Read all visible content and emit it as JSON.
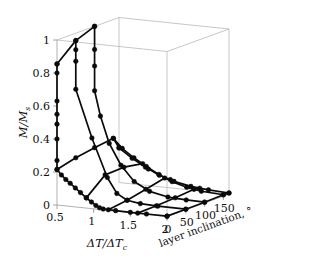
{
  "figure": {
    "name": "3d-surface-mesh-plot",
    "background": "#ffffff",
    "line_color": "#0a0a0a",
    "frame_color": "#b9b9b9",
    "width": 336,
    "height": 264
  },
  "axes": {
    "z": {
      "name": "M/Ms",
      "label_main": "M/M",
      "label_sub": "s",
      "ticks": [
        0,
        0.2,
        0.4,
        0.6,
        0.8,
        1
      ],
      "tick_labels": [
        "0",
        "0.2",
        "0.4",
        "0.6",
        "0.8",
        "1"
      ],
      "range": [
        0,
        1
      ]
    },
    "x": {
      "name": "delta-T-over-delta-Tc",
      "label_main": "ΔT/ΔT",
      "label_sub": "c",
      "ticks": [
        0.5,
        1,
        1.5,
        2
      ],
      "tick_labels": [
        "0.5",
        "1",
        "1.5",
        "2"
      ],
      "range": [
        0.5,
        2
      ]
    },
    "y": {
      "name": "layer-inclination",
      "label_main": "layer inclination, °",
      "ticks": [
        0,
        50,
        100,
        150
      ],
      "tick_labels": [
        "0",
        "50",
        "100",
        "150"
      ],
      "range": [
        0,
        165
      ]
    }
  },
  "chart_data": {
    "type": "line",
    "title": "",
    "xlabel": "ΔT/ΔTc",
    "ylabel": "layer inclination, °",
    "zlabel": "M/Ms",
    "xlim": [
      0.5,
      2
    ],
    "ylim": [
      0,
      165
    ],
    "zlim": [
      0,
      1
    ],
    "grid": false,
    "legend": "none",
    "projection": "3d",
    "series": [
      {
        "name": "inclination-0",
        "y": 0,
        "points": [
          {
            "x": 0.5,
            "z": 0.855
          },
          {
            "x": 0.5,
            "z": 0.8
          },
          {
            "x": 0.5,
            "z": 0.63
          },
          {
            "x": 0.5,
            "z": 0.55
          },
          {
            "x": 0.5,
            "z": 0.49
          },
          {
            "x": 0.5,
            "z": 0.4
          },
          {
            "x": 0.5,
            "z": 0.27
          },
          {
            "x": 0.5,
            "z": 0.215
          },
          {
            "x": 0.56,
            "z": 0.185
          },
          {
            "x": 0.62,
            "z": 0.16
          },
          {
            "x": 0.68,
            "z": 0.14
          },
          {
            "x": 0.75,
            "z": 0.115
          },
          {
            "x": 0.82,
            "z": 0.09
          },
          {
            "x": 0.9,
            "z": 0.062
          },
          {
            "x": 0.97,
            "z": 0.04
          },
          {
            "x": 1.03,
            "z": 0.022
          },
          {
            "x": 1.08,
            "z": 0.01
          },
          {
            "x": 1.13,
            "z": 0.005
          },
          {
            "x": 1.3,
            "z": 0.003
          },
          {
            "x": 1.5,
            "z": 0.002
          },
          {
            "x": 1.72,
            "z": 0.002
          },
          {
            "x": 2.0,
            "z": 0.002
          }
        ]
      },
      {
        "name": "inclination-50",
        "y": 50,
        "points": [
          {
            "x": 0.5,
            "z": 0.955
          },
          {
            "x": 0.5,
            "z": 0.9
          },
          {
            "x": 0.5,
            "z": 0.83
          },
          {
            "x": 0.5,
            "z": 0.66
          },
          {
            "x": 0.72,
            "z": 0.375
          },
          {
            "x": 0.93,
            "z": 0.145
          },
          {
            "x": 1.06,
            "z": 0.055
          },
          {
            "x": 1.2,
            "z": 0.02
          },
          {
            "x": 1.38,
            "z": 0.008
          },
          {
            "x": 1.62,
            "z": 0.004
          },
          {
            "x": 2.0,
            "z": 0.003
          }
        ]
      },
      {
        "name": "inclination-100",
        "y": 100,
        "points": [
          {
            "x": 0.5,
            "z": 1.0
          },
          {
            "x": 0.5,
            "z": 0.86
          },
          {
            "x": 0.5,
            "z": 0.76
          },
          {
            "x": 0.5,
            "z": 0.61
          },
          {
            "x": 0.58,
            "z": 0.46
          },
          {
            "x": 0.7,
            "z": 0.3
          },
          {
            "x": 0.86,
            "z": 0.175
          },
          {
            "x": 1.04,
            "z": 0.085
          },
          {
            "x": 1.25,
            "z": 0.035
          },
          {
            "x": 1.5,
            "z": 0.012
          },
          {
            "x": 1.75,
            "z": 0.006
          },
          {
            "x": 2.0,
            "z": 0.004
          }
        ]
      },
      {
        "name": "inclination-150",
        "y": 150,
        "points": [
          {
            "x": 0.5,
            "z": 0.28
          },
          {
            "x": 0.62,
            "z": 0.225
          },
          {
            "x": 0.78,
            "z": 0.175
          },
          {
            "x": 0.95,
            "z": 0.13
          },
          {
            "x": 1.12,
            "z": 0.09
          },
          {
            "x": 1.3,
            "z": 0.055
          },
          {
            "x": 1.5,
            "z": 0.03
          },
          {
            "x": 1.7,
            "z": 0.015
          },
          {
            "x": 2.0,
            "z": 0.008
          }
        ]
      },
      {
        "name": "inclination-165",
        "y": 165,
        "points": [
          {
            "x": 0.5,
            "z": 0.21
          },
          {
            "x": 0.68,
            "z": 0.155
          },
          {
            "x": 0.86,
            "z": 0.11
          },
          {
            "x": 1.05,
            "z": 0.07
          },
          {
            "x": 1.25,
            "z": 0.042
          },
          {
            "x": 1.48,
            "z": 0.022
          },
          {
            "x": 1.72,
            "z": 0.012
          },
          {
            "x": 2.0,
            "z": 0.006
          }
        ]
      }
    ],
    "cross_series": [
      {
        "name": "temp-0.5-cross",
        "x": 0.5,
        "points": [
          {
            "y": 0,
            "z": 0.855
          },
          {
            "y": 50,
            "z": 0.955
          },
          {
            "y": 100,
            "z": 1.0
          }
        ]
      },
      {
        "name": "temp-0.5-cross-low",
        "x": 0.5,
        "points": [
          {
            "y": 0,
            "z": 0.215
          },
          {
            "y": 50,
            "z": 0.245
          },
          {
            "y": 100,
            "z": 0.265
          },
          {
            "y": 150,
            "z": 0.28
          },
          {
            "y": 165,
            "z": 0.21
          }
        ]
      },
      {
        "name": "temp-0.9-cross",
        "x": 0.9,
        "points": [
          {
            "y": 0,
            "z": 0.062
          },
          {
            "y": 50,
            "z": 0.16
          },
          {
            "y": 100,
            "z": 0.165
          },
          {
            "y": 150,
            "z": 0.145
          },
          {
            "y": 165,
            "z": 0.1
          }
        ]
      },
      {
        "name": "temp-1.2-cross",
        "x": 1.2,
        "points": [
          {
            "y": 0,
            "z": 0.004
          },
          {
            "y": 50,
            "z": 0.02
          },
          {
            "y": 100,
            "z": 0.045
          },
          {
            "y": 150,
            "z": 0.072
          },
          {
            "y": 165,
            "z": 0.05
          }
        ]
      },
      {
        "name": "temp-1.6-cross",
        "x": 1.6,
        "points": [
          {
            "y": 0,
            "z": 0.002
          },
          {
            "y": 50,
            "z": 0.005
          },
          {
            "y": 100,
            "z": 0.012
          },
          {
            "y": 150,
            "z": 0.022
          },
          {
            "y": 165,
            "z": 0.016
          }
        ]
      },
      {
        "name": "temp-2.0-cross",
        "x": 2.0,
        "points": [
          {
            "y": 0,
            "z": 0.002
          },
          {
            "y": 50,
            "z": 0.003
          },
          {
            "y": 100,
            "z": 0.004
          },
          {
            "y": 150,
            "z": 0.008
          },
          {
            "y": 165,
            "z": 0.006
          }
        ]
      }
    ]
  }
}
